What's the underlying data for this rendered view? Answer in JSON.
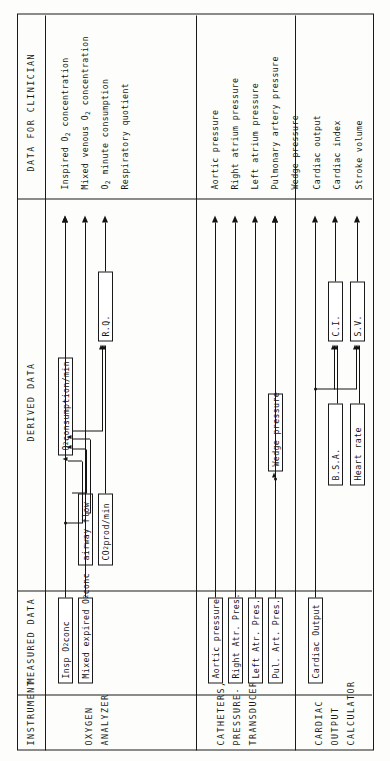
{
  "figure": {
    "orientation": "rotated-90",
    "columns": [
      {
        "id": "instrument",
        "label": "INSTRUMENT"
      },
      {
        "id": "measured",
        "label": "MEASURED DATA"
      },
      {
        "id": "derived",
        "label": "DERIVED DATA"
      },
      {
        "id": "clinician",
        "label": "DATA FOR CLINICIAN"
      }
    ],
    "instruments": [
      {
        "id": "oxygen-analyzer",
        "lines": [
          "OXYGEN",
          "ANALYZER"
        ]
      },
      {
        "id": "catheters-pressure-transducers",
        "lines": [
          "CATHETERS,",
          "PRESSURE-",
          "TRANSDUCERS"
        ]
      },
      {
        "id": "cardiac-output-calculator",
        "lines": [
          "CARDIAC",
          "OUTPUT",
          "CALCULATOR"
        ]
      }
    ],
    "measured_boxes": [
      {
        "id": "insp-o2-conc",
        "text": "Insp O₂ conc"
      },
      {
        "id": "mixed-expired-o2-conc",
        "text": "Mixed expired O₂ conc"
      },
      {
        "id": "aortic-pressure",
        "text": "Aortic pressure"
      },
      {
        "id": "right-atr-pres",
        "text": "Right Atr. Pres."
      },
      {
        "id": "left-atr-pres",
        "text": "Left Atr. Pres."
      },
      {
        "id": "pul-art-pres",
        "text": "Pul. Art. Pres."
      },
      {
        "id": "cardiac-output",
        "text": "Cardiac Output"
      }
    ],
    "derived_boxes": [
      {
        "id": "airway-flow",
        "text": "airway flow"
      },
      {
        "id": "co2-prod-min",
        "text": "CO₂ prod/min"
      },
      {
        "id": "o2-consumption-min",
        "text": "O₂ consumption/min"
      },
      {
        "id": "rq",
        "text": "R.Q."
      },
      {
        "id": "wedge-pressure",
        "text": "Wedge pressure"
      },
      {
        "id": "bsa",
        "text": "B.S.A."
      },
      {
        "id": "heart-rate",
        "text": "Heart rate"
      },
      {
        "id": "ci",
        "text": "C.I."
      },
      {
        "id": "sv",
        "text": "S.V."
      }
    ],
    "clinician_outputs": [
      {
        "id": "inspired-o2-concentration",
        "text": "Inspired O₂ concentration"
      },
      {
        "id": "mixed-venous-o2-concentration",
        "text": "Mixed venous O₂ concentration"
      },
      {
        "id": "o2-minute-consumption",
        "text": "O₂ minute consumption"
      },
      {
        "id": "respiratory-quotient",
        "text": "Respiratory quotient"
      },
      {
        "id": "aortic-pressure-out",
        "text": "Aortic pressure"
      },
      {
        "id": "right-atrium-pressure",
        "text": "Right atrium pressure"
      },
      {
        "id": "left-atrium-pressure",
        "text": "Left atrium pressure"
      },
      {
        "id": "pulmonary-artery-pressure",
        "text": "Pulmonary artery pressure"
      },
      {
        "id": "wedge-pressure-out",
        "text": "Wedge pressure"
      },
      {
        "id": "cardiac-output-out",
        "text": "Cardiac output"
      },
      {
        "id": "cardiac-index-out",
        "text": "Cardiac index"
      },
      {
        "id": "stroke-volume-out",
        "text": "Stroke volume"
      }
    ],
    "colors": {
      "ink": "#141414",
      "paper": "#fdfdfb"
    }
  }
}
